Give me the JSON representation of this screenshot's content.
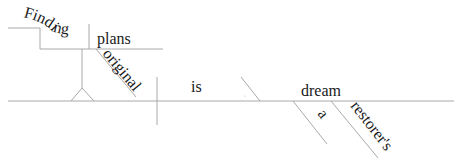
{
  "diagram": {
    "type": "Reed-Kellogg sentence diagram",
    "line_color": "#a9a9a9",
    "text_color": "#1a1a1a",
    "words": {
      "gerund": "Finding",
      "gerund_object": "plans",
      "object_modifier": "original",
      "verb": "is",
      "predicate_nominative": "dream",
      "article": "a",
      "possessive_modifier": "restorer's"
    }
  }
}
